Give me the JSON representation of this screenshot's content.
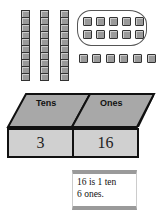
{
  "diagram": {
    "tens_rods": 3,
    "units_per_rod": 10,
    "grouped_ones": 10,
    "loose_ones": 6
  },
  "place_value_chart": {
    "headers": [
      "Tens",
      "Ones"
    ],
    "values": [
      "3",
      "16"
    ]
  },
  "note": {
    "line1": "16 is 1 ten",
    "line2": "6 ones."
  },
  "colors": {
    "block_fill": "#9a9a9a",
    "header_fill": "#a8a8a8",
    "value_fill": "#d0d0d0"
  }
}
